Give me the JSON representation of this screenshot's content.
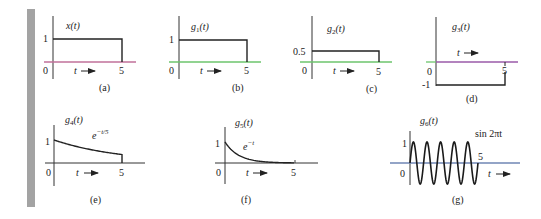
{
  "figure": {
    "panels": [
      {
        "id": "a",
        "caption": "(a)",
        "func_label": "x(t)",
        "func_base": "x",
        "func_sub": "",
        "y_tick": "1",
        "origin": "0",
        "x_tick": "5",
        "t_label": "t",
        "shape": "rect",
        "amplitude": 1,
        "axis_color": "#c0709a"
      },
      {
        "id": "b",
        "caption": "(b)",
        "func_label": "g1(t)",
        "func_base": "g",
        "func_sub": "1",
        "y_tick": "1",
        "origin": "0",
        "x_tick": "5",
        "t_label": "t",
        "shape": "rect",
        "amplitude": 1,
        "axis_color": "#6cc46c"
      },
      {
        "id": "c",
        "caption": "(c)",
        "func_label": "g2(t)",
        "func_base": "g",
        "func_sub": "2",
        "y_tick": "0.5",
        "origin": "0",
        "x_tick": "5",
        "t_label": "t",
        "shape": "rect",
        "amplitude": 0.5,
        "axis_color": "#6cc46c"
      },
      {
        "id": "d",
        "caption": "(d)",
        "func_label": "g3(t)",
        "func_base": "g",
        "func_sub": "3",
        "y_tick": "-1",
        "origin": "0",
        "x_tick": "5",
        "t_label": "t",
        "shape": "rect",
        "amplitude": -1,
        "axis_color": "#9a5aa8"
      },
      {
        "id": "e",
        "caption": "(e)",
        "func_label": "g4(t)",
        "func_base": "g",
        "func_sub": "4",
        "y_tick": "1",
        "origin": "0",
        "x_tick": "5",
        "t_label": "t",
        "expr": "e^{-t/5}",
        "expr_base": "e",
        "expr_sup": "−t/5",
        "shape": "exp",
        "decay": 0.2,
        "axis_color": "#333333"
      },
      {
        "id": "f",
        "caption": "(f)",
        "func_label": "g5(t)",
        "func_base": "g",
        "func_sub": "5",
        "y_tick": "1",
        "origin": "0",
        "x_tick": "5",
        "t_label": "t",
        "expr": "e^{-t}",
        "expr_base": "e",
        "expr_sup": "−t",
        "shape": "exp",
        "decay": 1,
        "axis_color": "#333333"
      },
      {
        "id": "g",
        "caption": "(g)",
        "func_label": "g6(t)",
        "func_base": "g",
        "func_sub": "6",
        "y_tick": "1",
        "origin": "0",
        "x_tick": "5",
        "t_label": "t",
        "expr": "sin 2πt",
        "shape": "sine",
        "cycles": 5,
        "axis_color": "#6f86b5"
      }
    ]
  },
  "chart_data": [
    {
      "type": "line",
      "title": "x(t)",
      "xlabel": "t",
      "ylabel": "x(t)",
      "x": [
        0,
        0,
        5,
        5
      ],
      "y": [
        0,
        1,
        1,
        0
      ],
      "xticks": [
        "0",
        "5"
      ],
      "yticks": [
        "1"
      ],
      "caption": "(a)"
    },
    {
      "type": "line",
      "title": "g1(t)",
      "xlabel": "t",
      "ylabel": "g1(t)",
      "x": [
        0,
        0,
        5,
        5
      ],
      "y": [
        0,
        1,
        1,
        0
      ],
      "xticks": [
        "0",
        "5"
      ],
      "yticks": [
        "1"
      ],
      "caption": "(b)"
    },
    {
      "type": "line",
      "title": "g2(t)",
      "xlabel": "t",
      "ylabel": "g2(t)",
      "x": [
        0,
        0,
        5,
        5
      ],
      "y": [
        0,
        0.5,
        0.5,
        0
      ],
      "xticks": [
        "0",
        "5"
      ],
      "yticks": [
        "0.5"
      ],
      "caption": "(c)"
    },
    {
      "type": "line",
      "title": "g3(t)",
      "xlabel": "t",
      "ylabel": "g3(t)",
      "x": [
        0,
        0,
        5,
        5
      ],
      "y": [
        0,
        -1,
        -1,
        0
      ],
      "xticks": [
        "0",
        "5"
      ],
      "yticks": [
        "-1"
      ],
      "caption": "(d)"
    },
    {
      "type": "line",
      "title": "g4(t)",
      "xlabel": "t",
      "ylabel": "g4(t)",
      "annotation": "e^{-t/5}",
      "x": [
        0,
        1,
        2,
        3,
        4,
        5,
        5
      ],
      "y": [
        1,
        0.819,
        0.67,
        0.549,
        0.449,
        0.368,
        0
      ],
      "xticks": [
        "0",
        "5"
      ],
      "yticks": [
        "1"
      ],
      "caption": "(e)"
    },
    {
      "type": "line",
      "title": "g5(t)",
      "xlabel": "t",
      "ylabel": "g5(t)",
      "annotation": "e^{-t}",
      "x": [
        0,
        0.5,
        1,
        2,
        3,
        4,
        5
      ],
      "y": [
        1,
        0.607,
        0.368,
        0.135,
        0.05,
        0.018,
        0.007
      ],
      "xticks": [
        "0",
        "5"
      ],
      "yticks": [
        "1"
      ],
      "caption": "(f)"
    },
    {
      "type": "line",
      "title": "g6(t)",
      "xlabel": "t",
      "ylabel": "g6(t)",
      "annotation": "sin 2πt",
      "x": [
        0,
        0.25,
        0.5,
        0.75,
        1,
        1.25,
        1.5,
        1.75,
        2,
        2.25,
        2.5,
        2.75,
        3,
        3.25,
        3.5,
        3.75,
        4,
        4.25,
        4.5,
        4.75,
        5
      ],
      "y": [
        0,
        1,
        0,
        -1,
        0,
        1,
        0,
        -1,
        0,
        1,
        0,
        -1,
        0,
        1,
        0,
        -1,
        0,
        1,
        0,
        -1,
        0
      ],
      "xticks": [
        "0",
        "5"
      ],
      "yticks": [
        "1"
      ],
      "caption": "(g)"
    }
  ]
}
